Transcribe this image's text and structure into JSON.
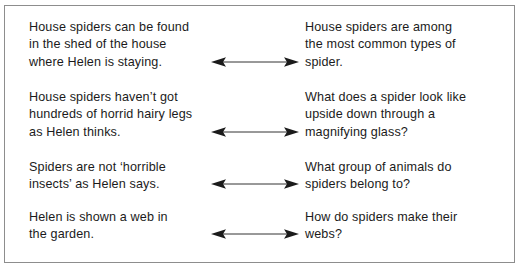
{
  "document": {
    "type": "matching-exercise",
    "clipped_text_above": "· · · · · · ·",
    "border_color": "#8d8d8d",
    "text_color": "#1b1b1b",
    "arrow_color": "#1b1b1b",
    "arrow_icon_name": "double-headed-arrow-icon",
    "pairs": [
      {
        "statement_lines": [
          "House spiders can be found",
          "in the shed of the house",
          "where Helen is staying."
        ],
        "question_lines": [
          "House spiders are among",
          "the most common types of",
          "spider."
        ],
        "arrow_top": 36
      },
      {
        "statement_lines": [
          "House spiders haven’t got",
          "hundreds of horrid hairy legs",
          "as Helen thinks."
        ],
        "question_lines": [
          "What does a spider look like",
          "upside down through a",
          "magnifying glass?"
        ],
        "arrow_top": 36
      },
      {
        "statement_lines": [
          "Spiders are not ‘horrible",
          "insects’ as Helen says."
        ],
        "question_lines": [
          "What group of animals do",
          "spiders belong to?"
        ],
        "arrow_top": 18
      },
      {
        "statement_lines": [
          "Helen is shown a web in",
          "the garden."
        ],
        "question_lines": [
          "How do spiders make their",
          "webs?"
        ],
        "arrow_top": 18
      }
    ]
  }
}
